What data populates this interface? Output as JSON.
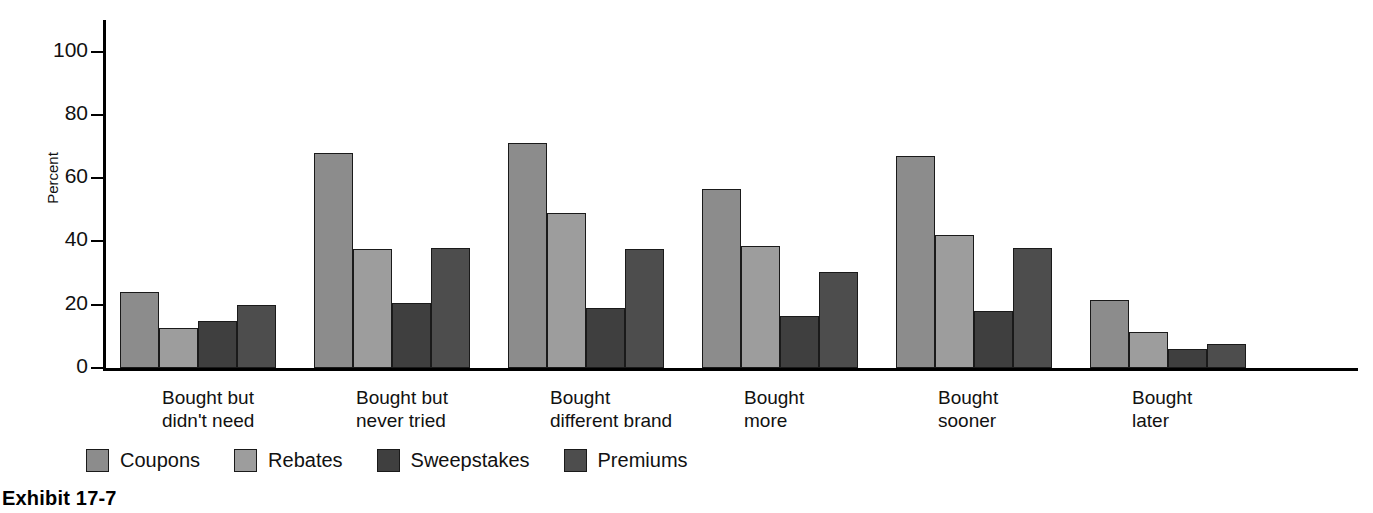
{
  "caption": "Exhibit 17-7",
  "axis": {
    "y_title": "Percent",
    "y_ticks": [
      "0",
      "20",
      "40",
      "60",
      "80",
      "100"
    ]
  },
  "legend": {
    "items": [
      {
        "label": "Coupons",
        "color": "#8c8c8c",
        "swatch_name": "legend-swatch-coupons"
      },
      {
        "label": "Rebates",
        "color": "#9d9d9d",
        "swatch_name": "legend-swatch-rebates"
      },
      {
        "label": "Sweepstakes",
        "color": "#3f3f3f",
        "swatch_name": "legend-swatch-sweepstakes"
      },
      {
        "label": "Premiums",
        "color": "#4d4d4d",
        "swatch_name": "legend-swatch-premiums"
      }
    ]
  },
  "chart_data": {
    "type": "bar",
    "title": "Exhibit 17-7",
    "xlabel": "",
    "ylabel": "Percent",
    "ylim": [
      0,
      110
    ],
    "yticks": [
      0,
      20,
      40,
      60,
      80,
      100
    ],
    "grid": false,
    "legend_position": "bottom-left",
    "categories": [
      "Bought but\ndidn't need",
      "Bought but\nnever tried",
      "Bought\ndifferent brand",
      "Bought\nmore",
      "Bought\nsooner",
      "Bought\nlater"
    ],
    "series": [
      {
        "name": "Coupons",
        "color": "#8c8c8c",
        "values": [
          24,
          68,
          71,
          56.5,
          67,
          21.5
        ]
      },
      {
        "name": "Rebates",
        "color": "#9d9d9d",
        "values": [
          12.5,
          37.5,
          49,
          38.5,
          42,
          11.5
        ]
      },
      {
        "name": "Sweepstakes",
        "color": "#3f3f3f",
        "values": [
          15,
          20.5,
          19,
          16.5,
          18,
          6
        ]
      },
      {
        "name": "Premiums",
        "color": "#4d4d4d",
        "values": [
          20,
          38,
          37.5,
          30.5,
          38,
          7.5
        ]
      }
    ]
  }
}
